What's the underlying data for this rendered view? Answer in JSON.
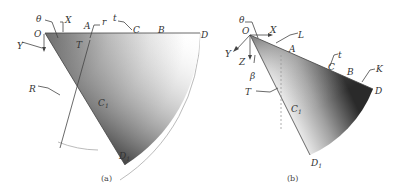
{
  "figure_a": {
    "caption": "(a)",
    "labels": {
      "theta": "θ",
      "X": "X",
      "Y": "Y",
      "O": "O",
      "A": "A",
      "r": "r",
      "t": "t",
      "C": "C",
      "B": "B",
      "D": "D",
      "T": "T",
      "R": "R",
      "C1": "C",
      "C1_sub": "1",
      "D1": "D",
      "D1_sub": "1"
    }
  },
  "figure_b": {
    "caption": "(b)",
    "labels": {
      "theta": "θ",
      "X": "X",
      "Y": "Y",
      "Z": "Z",
      "O": "O",
      "L": "L",
      "A": "A",
      "t": "t",
      "C": "C",
      "B": "B",
      "K": "K",
      "D": "D",
      "beta": "β",
      "T": "T",
      "C1": "C",
      "C1_sub": "1",
      "D1": "D",
      "D1_sub": "1"
    }
  },
  "colors": {
    "dark": "#2a2a2a",
    "mid": "#8a8a8a",
    "light": "#ffffff",
    "line": "#444444",
    "arc": "#aaaaaa"
  }
}
